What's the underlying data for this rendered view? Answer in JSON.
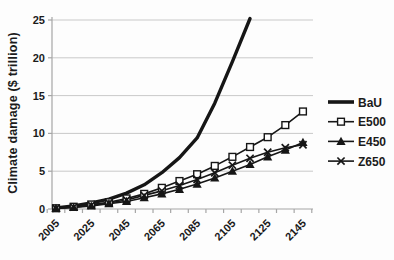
{
  "figure": {
    "background": "#fdfdfd",
    "line_color": "#161616",
    "grid_color": "#c9c9c9",
    "axis_color": "#a6a6a6",
    "text_color": "#1b1b1b"
  },
  "chart_data": {
    "type": "line",
    "title": "",
    "xlabel": "",
    "ylabel": "Climate damage ($ trillion)",
    "ylim": [
      0,
      25
    ],
    "y_ticks": [
      0,
      5,
      10,
      15,
      20,
      25
    ],
    "x_categories": [
      2005,
      2015,
      2025,
      2035,
      2045,
      2055,
      2065,
      2075,
      2085,
      2095,
      2105,
      2115,
      2125,
      2135,
      2145
    ],
    "x_tick_labels": [
      "2005",
      "2025",
      "2045",
      "2065",
      "2085",
      "2105",
      "2125",
      "2145"
    ],
    "grid": "horizontal-only",
    "legend_position": "right",
    "series": [
      {
        "name": "BaU",
        "marker": "none",
        "line": "thick",
        "values": [
          0.15,
          0.4,
          0.8,
          1.3,
          2.1,
          3.2,
          4.8,
          6.8,
          9.4,
          14.0,
          19.5,
          25.2,
          null,
          null,
          null
        ]
      },
      {
        "name": "E500",
        "marker": "open-square",
        "line": "thin",
        "values": [
          0.1,
          0.3,
          0.6,
          0.9,
          1.4,
          2.0,
          2.8,
          3.7,
          4.6,
          5.7,
          6.9,
          8.2,
          9.5,
          11.1,
          12.9
        ]
      },
      {
        "name": "E450",
        "marker": "filled-triangle",
        "line": "thin",
        "values": [
          0.1,
          0.2,
          0.4,
          0.7,
          1.0,
          1.5,
          2.0,
          2.6,
          3.3,
          4.1,
          5.0,
          5.9,
          6.9,
          7.8,
          8.8
        ]
      },
      {
        "name": "Z650",
        "marker": "x-cross",
        "line": "thin",
        "values": [
          0.1,
          0.25,
          0.5,
          0.8,
          1.2,
          1.8,
          2.4,
          3.1,
          3.9,
          4.8,
          5.8,
          6.7,
          7.5,
          8.1,
          8.5
        ]
      }
    ]
  }
}
